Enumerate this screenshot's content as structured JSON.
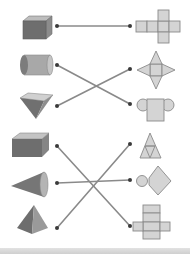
{
  "colors": {
    "shape_dark": "#6e6e6e",
    "shape_mid": "#8c8c8c",
    "shape_light": "#bdbdbd",
    "net_fill": "#d4d4d4",
    "net_stroke": "#8a8a8a",
    "line": "#8a8a8a",
    "dot": "#3a3a3a",
    "footer": "#d6d6d6"
  },
  "solids": [
    {
      "id": "cube",
      "label": "cube",
      "dot": [
        57,
        26
      ]
    },
    {
      "id": "cylinder",
      "label": "cylinder",
      "dot": [
        57,
        65
      ]
    },
    {
      "id": "square-pyramid-inverted",
      "label": "inverted square pyramid",
      "dot": [
        57,
        106
      ]
    },
    {
      "id": "rectangular-prism",
      "label": "rectangular prism",
      "dot": [
        57,
        146
      ]
    },
    {
      "id": "cone",
      "label": "cone",
      "dot": [
        57,
        183
      ]
    },
    {
      "id": "square-pyramid",
      "label": "square pyramid",
      "dot": [
        57,
        228
      ]
    }
  ],
  "nets": [
    {
      "id": "cube-net",
      "label": "cross-shaped cube net",
      "dot": [
        130,
        26
      ]
    },
    {
      "id": "square-pyramid-net",
      "label": "star-shaped square pyramid net",
      "dot": [
        130,
        69
      ]
    },
    {
      "id": "cylinder-net",
      "label": "cylinder net (rectangle with two circles)",
      "dot": [
        130,
        104
      ]
    },
    {
      "id": "tetrahedron-net",
      "label": "triangular net",
      "dot": [
        130,
        144
      ]
    },
    {
      "id": "cone-net",
      "label": "cone net (circle with sector)",
      "dot": [
        130,
        180
      ]
    },
    {
      "id": "prism-net",
      "label": "rectangular prism net",
      "dot": [
        130,
        226
      ]
    }
  ],
  "connections": [
    {
      "from": "cube",
      "to": "cube-net"
    },
    {
      "from": "cylinder",
      "to": "cylinder-net"
    },
    {
      "from": "square-pyramid-inverted",
      "to": "square-pyramid-net"
    },
    {
      "from": "rectangular-prism",
      "to": "prism-net"
    },
    {
      "from": "cone",
      "to": "cone-net"
    },
    {
      "from": "square-pyramid",
      "to": "tetrahedron-net"
    }
  ]
}
